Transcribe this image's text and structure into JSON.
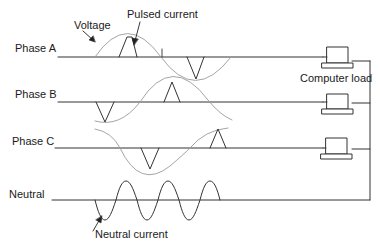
{
  "diagram": {
    "labels": {
      "voltage": "Voltage",
      "pulsed_current": "Pulsed current",
      "phase_a": "Phase A",
      "phase_b": "Phase B",
      "phase_c": "Phase C",
      "neutral": "Neutral",
      "computer_load": "Computer load",
      "neutral_current": "Neutral current"
    },
    "colors": {
      "line": "#333333",
      "voltage_curve": "#9a9a9a",
      "current_pulse": "#333333"
    },
    "loads": [
      {
        "phase": "Phase A",
        "icon": "computer-icon"
      },
      {
        "phase": "Phase B",
        "icon": "computer-icon"
      },
      {
        "phase": "Phase C",
        "icon": "computer-icon"
      }
    ]
  }
}
